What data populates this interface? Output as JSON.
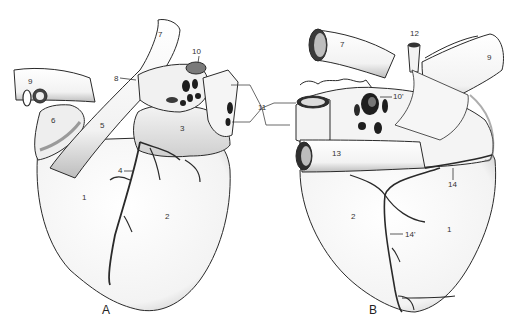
{
  "figure": {
    "type": "anatomical-line-drawing",
    "colors": {
      "background": "#ffffff",
      "outline": "#2a2a2a",
      "shading": "#6e6e6e",
      "fill": "#f6f6f6",
      "vessel_lumen": "#1e1e1e"
    }
  },
  "views": [
    {
      "id": "A",
      "label": "A",
      "labels": [
        {
          "text": "1",
          "x": 82,
          "y": 198
        },
        {
          "text": "2",
          "x": 166,
          "y": 216
        },
        {
          "text": "3",
          "x": 181,
          "y": 128
        },
        {
          "text": "4",
          "x": 119,
          "y": 168
        },
        {
          "text": "5",
          "x": 100,
          "y": 125
        },
        {
          "text": "6",
          "x": 51,
          "y": 119
        },
        {
          "text": "7",
          "x": 158,
          "y": 32
        },
        {
          "text": "8",
          "x": 114,
          "y": 75
        },
        {
          "text": "9",
          "x": 28,
          "y": 79
        },
        {
          "text": "10",
          "x": 193,
          "y": 48
        }
      ]
    },
    {
      "id": "B",
      "label": "B",
      "labels": [
        {
          "text": "1",
          "x": 447,
          "y": 227
        },
        {
          "text": "2",
          "x": 351,
          "y": 215
        },
        {
          "text": "7",
          "x": 340,
          "y": 41
        },
        {
          "text": "9",
          "x": 487,
          "y": 54
        },
        {
          "text": "10'",
          "x": 393,
          "y": 94
        },
        {
          "text": "12",
          "x": 410,
          "y": 30
        },
        {
          "text": "13",
          "x": 333,
          "y": 151
        },
        {
          "text": "14",
          "x": 449,
          "y": 181
        },
        {
          "text": "14'",
          "x": 405,
          "y": 232
        }
      ]
    }
  ],
  "shared_labels": [
    {
      "text": "11",
      "x": 258,
      "y": 107
    }
  ]
}
